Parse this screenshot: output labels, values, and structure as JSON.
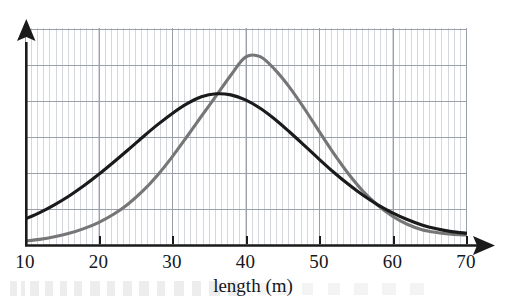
{
  "chart_data": {
    "type": "line",
    "title": "",
    "subtitle": "",
    "xlabel": "length (m)",
    "ylabel": "",
    "xlim": [
      10,
      70
    ],
    "ylim": [
      0,
      1
    ],
    "grid": true,
    "grid_major_x_step": 10,
    "grid_minor_x_step": 0.8333,
    "grid_major_y_count": 6,
    "legend": "none",
    "legend_position": "none",
    "x_ticks": [
      10,
      20,
      30,
      40,
      50,
      60,
      70
    ],
    "x_tick_labels": [
      "10",
      "20",
      "30",
      "40",
      "50",
      "60",
      "70"
    ],
    "y_ticks": [],
    "y_tick_labels": [],
    "axis_arrows": [
      "x-right",
      "y-up"
    ],
    "annotations": [],
    "series": [
      {
        "name": "black-curve",
        "color": "#1a1a1a",
        "line_width": 3.1,
        "mean": 34.5,
        "sigma": 11.0,
        "peak_x": 34.5,
        "peak_y": 0.7,
        "x": [
          10,
          12,
          14,
          16,
          18,
          20,
          22,
          24,
          26,
          28,
          30,
          32,
          34,
          36,
          38,
          40,
          42,
          44,
          46,
          48,
          50,
          52,
          54,
          56,
          58,
          60,
          62,
          64,
          66,
          68,
          70
        ],
        "y": [
          0.12,
          0.15,
          0.186,
          0.227,
          0.274,
          0.326,
          0.382,
          0.44,
          0.499,
          0.556,
          0.608,
          0.653,
          0.686,
          0.7,
          0.695,
          0.672,
          0.633,
          0.582,
          0.523,
          0.461,
          0.398,
          0.337,
          0.281,
          0.23,
          0.186,
          0.149,
          0.118,
          0.093,
          0.075,
          0.062,
          0.055
        ]
      },
      {
        "name": "gray-curve",
        "color": "#767676",
        "line_width": 3.1,
        "mean": 40.0,
        "sigma": 9.0,
        "peak_x": 40.0,
        "peak_y": 0.885,
        "x": [
          10,
          12,
          14,
          16,
          18,
          20,
          22,
          24,
          26,
          28,
          30,
          32,
          34,
          36,
          38,
          40,
          42,
          44,
          46,
          48,
          50,
          52,
          54,
          56,
          58,
          60,
          62,
          64,
          66,
          68,
          70
        ],
        "y": [
          0.018,
          0.026,
          0.038,
          0.054,
          0.076,
          0.104,
          0.141,
          0.189,
          0.249,
          0.322,
          0.407,
          0.5,
          0.596,
          0.69,
          0.786,
          0.87,
          0.872,
          0.812,
          0.73,
          0.632,
          0.527,
          0.424,
          0.33,
          0.249,
          0.184,
          0.133,
          0.096,
          0.071,
          0.058,
          0.05,
          0.046
        ]
      }
    ]
  },
  "axes": {
    "x_title": "length (m)",
    "x_tick_labels": [
      "10",
      "20",
      "30",
      "40",
      "50",
      "60",
      "70"
    ]
  },
  "colors": {
    "series_black": "#1a1a1a",
    "series_gray": "#767676",
    "grid_minor": "#c9cdd4",
    "grid_major": "#9fa5ae",
    "axis": "#1a1a1a",
    "text": "#14171c",
    "background": "#ffffff"
  }
}
